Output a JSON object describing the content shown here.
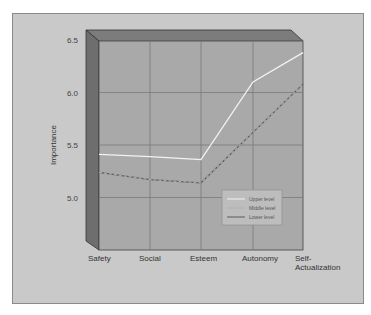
{
  "chart_data": {
    "type": "line",
    "title": "",
    "xlabel": "",
    "ylabel": "Importance",
    "categories": [
      "Safety",
      "Social",
      "Esteem",
      "Autonomy",
      "Self-Actualization"
    ],
    "category_labels": [
      [
        "Safety"
      ],
      [
        "Social"
      ],
      [
        "Esteem"
      ],
      [
        "Autonomy"
      ],
      [
        "Self-",
        "Actualization"
      ]
    ],
    "yticks": [
      "5.0",
      "5.5",
      "6.0",
      "6.5"
    ],
    "ylim": [
      4.5,
      6.5
    ],
    "grid": true,
    "legend_position": "lower-right-inside",
    "series": [
      {
        "name": "Upper level",
        "values": [
          5.41,
          5.39,
          5.36,
          6.1,
          6.38
        ],
        "color": "#f2f2f2",
        "style": "solid"
      },
      {
        "name": "Middle level",
        "values": [
          5.24,
          5.17,
          5.14,
          5.62,
          6.08
        ],
        "color": "#a8a8a8",
        "style": "dashed"
      },
      {
        "name": "Lower level",
        "values": [
          5.24,
          5.17,
          5.14,
          5.62,
          6.08
        ],
        "color": "#5a5a5a",
        "style": "solid"
      }
    ]
  },
  "legend": {
    "items": [
      "Upper level",
      "Middle level",
      "Lower level"
    ]
  },
  "colors": {
    "panel": "#c9c9c9",
    "plot_bg": "#a9a9a9",
    "grid": "#7a7a7a",
    "wall_left": "#6e6e6e",
    "wall_top": "#7c7c7c"
  }
}
